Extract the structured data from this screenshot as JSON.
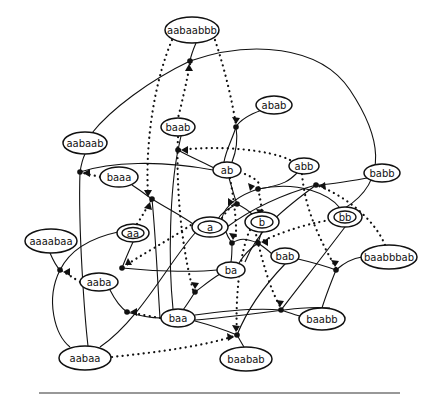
{
  "diagram": {
    "type": "state-transition graph",
    "nodes": [
      {
        "id": "aabaabbb",
        "label": "aabaabbb",
        "x": 192,
        "y": 30,
        "rx": 27,
        "ry": 13,
        "double": false
      },
      {
        "id": "aabaab",
        "label": "aabaab",
        "x": 85,
        "y": 143,
        "rx": 22,
        "ry": 11,
        "double": false
      },
      {
        "id": "baab",
        "label": "baab",
        "x": 178,
        "y": 127,
        "rx": 17,
        "ry": 9,
        "double": false
      },
      {
        "id": "abab",
        "label": "abab",
        "x": 274,
        "y": 105,
        "rx": 18,
        "ry": 9,
        "double": false
      },
      {
        "id": "baaa",
        "label": "baaa",
        "x": 119,
        "y": 177,
        "rx": 19,
        "ry": 10,
        "double": false
      },
      {
        "id": "ab",
        "label": "ab",
        "x": 227,
        "y": 170,
        "rx": 14,
        "ry": 8,
        "double": false
      },
      {
        "id": "abb",
        "label": "abb",
        "x": 304,
        "y": 166,
        "rx": 15,
        "ry": 8,
        "double": false
      },
      {
        "id": "babb",
        "label": "babb",
        "x": 382,
        "y": 173,
        "rx": 18,
        "ry": 9,
        "double": false
      },
      {
        "id": "aa",
        "label": "aa",
        "x": 133,
        "y": 233,
        "rx": 16,
        "ry": 9,
        "double": true
      },
      {
        "id": "a",
        "label": "a",
        "x": 210,
        "y": 227,
        "rx": 18,
        "ry": 10,
        "double": true
      },
      {
        "id": "b",
        "label": "b",
        "x": 262,
        "y": 222,
        "rx": 17,
        "ry": 10,
        "double": true
      },
      {
        "id": "bb",
        "label": "bb",
        "x": 345,
        "y": 217,
        "rx": 17,
        "ry": 10,
        "double": true
      },
      {
        "id": "aaaabaa",
        "label": "aaaabaa",
        "x": 51,
        "y": 241,
        "rx": 26,
        "ry": 12,
        "double": false
      },
      {
        "id": "aaba",
        "label": "aaba",
        "x": 99,
        "y": 282,
        "rx": 19,
        "ry": 9,
        "double": false
      },
      {
        "id": "ba",
        "label": "ba",
        "x": 231,
        "y": 270,
        "rx": 14,
        "ry": 8,
        "double": false
      },
      {
        "id": "bab",
        "label": "bab",
        "x": 285,
        "y": 256,
        "rx": 14,
        "ry": 8,
        "double": false
      },
      {
        "id": "baabbbab",
        "label": "baabbbab",
        "x": 389,
        "y": 257,
        "rx": 28,
        "ry": 12,
        "double": false
      },
      {
        "id": "baa",
        "label": "baa",
        "x": 178,
        "y": 318,
        "rx": 17,
        "ry": 9,
        "double": false
      },
      {
        "id": "baabb",
        "label": "baabb",
        "x": 322,
        "y": 319,
        "rx": 23,
        "ry": 11,
        "double": false
      },
      {
        "id": "aabaa",
        "label": "aabaa",
        "x": 85,
        "y": 358,
        "rx": 26,
        "ry": 12,
        "double": false
      },
      {
        "id": "baabab",
        "label": "baabab",
        "x": 246,
        "y": 359,
        "rx": 26,
        "ry": 12,
        "double": false
      }
    ],
    "junctions": [
      {
        "x": 190,
        "y": 61
      },
      {
        "x": 236,
        "y": 127
      },
      {
        "x": 178,
        "y": 150
      },
      {
        "x": 80,
        "y": 172
      },
      {
        "x": 152,
        "y": 199
      },
      {
        "x": 258,
        "y": 189
      },
      {
        "x": 237,
        "y": 204
      },
      {
        "x": 122,
        "y": 268
      },
      {
        "x": 60,
        "y": 270
      },
      {
        "x": 232,
        "y": 243
      },
      {
        "x": 258,
        "y": 243
      },
      {
        "x": 316,
        "y": 185
      },
      {
        "x": 195,
        "y": 292
      },
      {
        "x": 127,
        "y": 312
      },
      {
        "x": 336,
        "y": 270
      },
      {
        "x": 281,
        "y": 310
      },
      {
        "x": 237,
        "y": 335
      }
    ]
  }
}
